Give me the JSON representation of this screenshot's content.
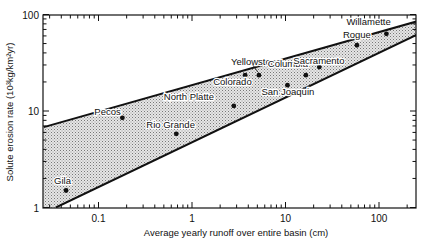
{
  "chart_data": {
    "type": "scatter",
    "title": "",
    "xlabel": "Average yearly runoff over entire basin (cm)",
    "ylabel": "Solute erosion rate (10³kg/km²yr)",
    "xscale": "log",
    "yscale": "log",
    "xlim": [
      0.026,
      255
    ],
    "ylim": [
      1,
      100
    ],
    "x_ticks": [
      "0.1",
      "1",
      "10",
      "100"
    ],
    "y_ticks": [
      "1",
      "10",
      "100"
    ],
    "grid": false,
    "legend": null,
    "points": [
      {
        "name": "Gila",
        "x": 0.045,
        "y": 1.5
      },
      {
        "name": "Pecos",
        "x": 0.18,
        "y": 8.5
      },
      {
        "name": "Rio Grande",
        "x": 0.68,
        "y": 5.8
      },
      {
        "name": "North Platte",
        "x": 2.8,
        "y": 11.3
      },
      {
        "name": "Colorado",
        "x": 3.7,
        "y": 23.5
      },
      {
        "name": "Yellowstone",
        "x": 5.2,
        "y": 23.5
      },
      {
        "name": "San Joaquin",
        "x": 10.5,
        "y": 18.5
      },
      {
        "name": "Columbia",
        "x": 16.5,
        "y": 23.5
      },
      {
        "name": "Sacramento",
        "x": 23,
        "y": 28.5
      },
      {
        "name": "Rogue",
        "x": 58,
        "y": 48
      },
      {
        "name": "Willamette",
        "x": 120,
        "y": 63
      }
    ],
    "envelope": {
      "upper_line": [
        [
          0.026,
          6.8
        ],
        [
          255,
          85
        ]
      ],
      "lower_line": [
        [
          0.035,
          1.0
        ],
        [
          255,
          62
        ]
      ],
      "fill": "stippled gray"
    }
  },
  "colors": {
    "axis": "#111111",
    "band_fill": "#bdbdbd",
    "point": "#111111"
  }
}
